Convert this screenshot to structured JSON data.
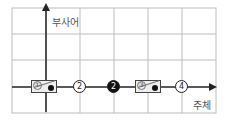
{
  "axes": {
    "y_label": "부사어",
    "x_label": "주체"
  },
  "nodes": [
    {
      "type": "box",
      "number": "①",
      "has_dot": true
    },
    {
      "type": "circle",
      "label": "2",
      "filled": false
    },
    {
      "type": "circle",
      "label": "2",
      "filled": true
    },
    {
      "type": "box",
      "number": "③",
      "has_dot": true
    },
    {
      "type": "circle",
      "label": "4",
      "filled": false
    }
  ],
  "n1": "①",
  "n2": "2",
  "n3": "2",
  "n4": "③",
  "n5": "4",
  "colors": {
    "line": "#222222",
    "grid": "#bbbbbb",
    "box_fill": "#eeeeee"
  }
}
